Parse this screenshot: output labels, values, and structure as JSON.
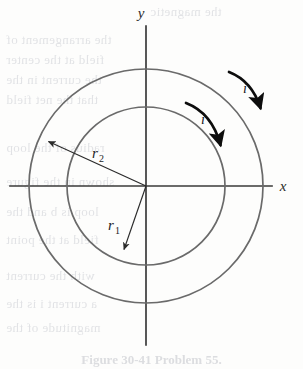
{
  "figure": {
    "kind": "physics-diagram",
    "background_color": "#fdfdfc",
    "axes": {
      "x_label": "x",
      "y_label": "y",
      "axis_color": "#3a3a3a",
      "origin": {
        "x": 146,
        "y": 186
      },
      "x_axis": {
        "x1": 10,
        "y1": 186,
        "x2": 272,
        "y2": 186
      },
      "y_axis": {
        "x1": 146,
        "y1": 26,
        "x2": 146,
        "y2": 345
      }
    },
    "circles": [
      {
        "name": "inner-loop",
        "radius_label": "r",
        "radius_subscript": "1",
        "radius_px": 79,
        "stroke": "#6a6a6a",
        "stroke_width": 1.6
      },
      {
        "name": "outer-loop",
        "radius_label": "r",
        "radius_subscript": "2",
        "radius_px": 117,
        "stroke": "#6a6a6a",
        "stroke_width": 1.6
      }
    ],
    "radius_arrows": [
      {
        "name": "r2-arrow",
        "label": "r",
        "subscript": "2",
        "from": {
          "x": 146,
          "y": 186
        },
        "to": {
          "x": 45,
          "y": 140
        },
        "label_pos": {
          "x": 92,
          "y": 155
        },
        "color": "#2b2b2b"
      },
      {
        "name": "r1-arrow",
        "label": "r",
        "subscript": "1",
        "from": {
          "x": 146,
          "y": 186
        },
        "to": {
          "x": 122,
          "y": 253
        },
        "label_pos": {
          "x": 114,
          "y": 226
        },
        "color": "#2b2b2b"
      }
    ],
    "current_arrows": [
      {
        "name": "outer-current-arrow",
        "label": "i",
        "direction": "clockwise",
        "label_pos": {
          "x": 245,
          "y": 89
        },
        "color": "#0d0d0d"
      },
      {
        "name": "inner-current-arrow",
        "label": "i",
        "direction": "clockwise",
        "label_pos": {
          "x": 203,
          "y": 120
        },
        "color": "#0d0d0d"
      }
    ],
    "caption": "Figure 30-41  Problem 55.",
    "bleed_through_text": [
      {
        "text": "the magnetic",
        "x": 150,
        "y": 4
      },
      {
        "text": "the arrangement of",
        "x": 6,
        "y": 32
      },
      {
        "text": "field at the center",
        "x": 6,
        "y": 52
      },
      {
        "text": "the current in the",
        "x": 6,
        "y": 72
      },
      {
        "text": "that the net field",
        "x": 6,
        "y": 92
      },
      {
        "text": "radius of the loop",
        "x": 6,
        "y": 140
      },
      {
        "text": "shown in the figure",
        "x": 6,
        "y": 174
      },
      {
        "text": "loop is b and the",
        "x": 6,
        "y": 204
      },
      {
        "text": "field at the point",
        "x": 6,
        "y": 232
      },
      {
        "text": "with the current",
        "x": 6,
        "y": 268
      },
      {
        "text": "a current i is the",
        "x": 6,
        "y": 296
      },
      {
        "text": "magnitude of the",
        "x": 6,
        "y": 320
      }
    ]
  }
}
